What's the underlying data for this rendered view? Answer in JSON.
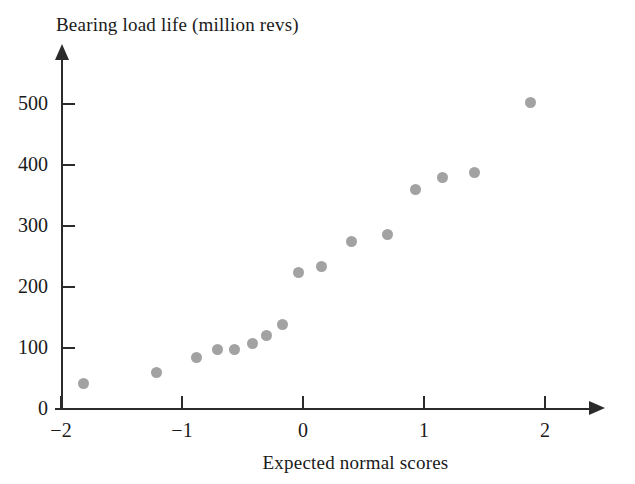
{
  "chart_data": {
    "type": "scatter",
    "title": "",
    "xlabel": "Expected normal scores",
    "ylabel": "Bearing load life (million revs)",
    "xlim": [
      -2.2,
      2.45
    ],
    "ylim": [
      0,
      575
    ],
    "grid": false,
    "legend": null,
    "marker": {
      "shape": "circle",
      "color": "#a2a2a2",
      "size_px": 11
    },
    "xticks": [
      -2,
      -1,
      0,
      1,
      2
    ],
    "xtick_labels": [
      "−2",
      "−1",
      "0",
      "1",
      "2"
    ],
    "yticks": [
      0,
      100,
      200,
      300,
      400,
      500
    ],
    "ytick_labels": [
      "0",
      "100",
      "200",
      "300",
      "400",
      "500"
    ],
    "points": [
      {
        "x": -1.81,
        "y": 41
      },
      {
        "x": -1.21,
        "y": 59
      },
      {
        "x": -0.88,
        "y": 84
      },
      {
        "x": -0.71,
        "y": 98
      },
      {
        "x": -0.57,
        "y": 97
      },
      {
        "x": -0.42,
        "y": 108
      },
      {
        "x": -0.3,
        "y": 120
      },
      {
        "x": -0.17,
        "y": 139
      },
      {
        "x": -0.04,
        "y": 223
      },
      {
        "x": 0.15,
        "y": 234
      },
      {
        "x": 0.4,
        "y": 274
      },
      {
        "x": 0.7,
        "y": 285
      },
      {
        "x": 0.93,
        "y": 359
      },
      {
        "x": 1.15,
        "y": 379
      },
      {
        "x": 1.42,
        "y": 387
      },
      {
        "x": 1.88,
        "y": 502
      }
    ]
  },
  "axes": {
    "y_title": "Bearing load life (million revs)",
    "x_title": "Expected normal scores"
  }
}
